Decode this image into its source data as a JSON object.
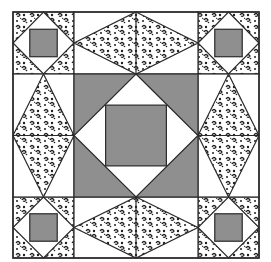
{
  "colors": {
    "background": "#ffffff",
    "gray_fill": "#8f8f8f",
    "outline": "#2a2a2a",
    "print_dark": "#1e1e1e",
    "white_fill": "#ffffff"
  },
  "layout": {
    "x0": 13,
    "y0": 12,
    "x1": 259,
    "y1": 258,
    "grid_x": [
      13,
      74,
      198,
      259
    ],
    "grid_y": [
      12,
      74,
      197,
      258
    ]
  },
  "units": {
    "corners": [
      {
        "name": "corner-top-left",
        "col": 0,
        "row": 0
      },
      {
        "name": "corner-top-right",
        "col": 2,
        "row": 0
      },
      {
        "name": "corner-bottom-left",
        "col": 0,
        "row": 2
      },
      {
        "name": "corner-bottom-right",
        "col": 2,
        "row": 2
      }
    ],
    "sides": [
      {
        "name": "side-top",
        "col": 1,
        "row": 0,
        "orientation": "horizontal"
      },
      {
        "name": "side-bottom",
        "col": 1,
        "row": 2,
        "orientation": "horizontal"
      },
      {
        "name": "side-left",
        "col": 0,
        "row": 1,
        "orientation": "vertical"
      },
      {
        "name": "side-right",
        "col": 2,
        "row": 1,
        "orientation": "vertical"
      }
    ],
    "center": {
      "name": "center-square",
      "col": 1,
      "row": 1
    }
  }
}
